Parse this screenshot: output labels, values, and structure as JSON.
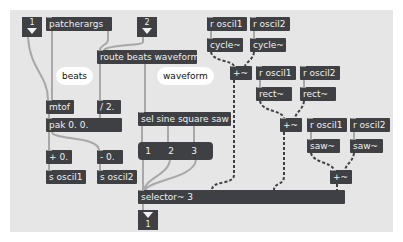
{
  "patch": {
    "inlets": [
      {
        "number": "1"
      },
      {
        "number": "2"
      }
    ],
    "outlets": [
      {
        "number": "1"
      }
    ],
    "objects": {
      "patcherargs": "patcherargs",
      "route": "route beats waveform",
      "mtof": "mtof",
      "div2": "/ 2.",
      "pak": "pak 0. 0.",
      "plus0": "+ 0.",
      "minus0": "- 0.",
      "s_oscil1": "s oscil1",
      "s_oscil2": "s oscil2",
      "sel": "sel sine square saw",
      "selector": "selector~ 3",
      "r_oscil1": "r oscil1",
      "r_oscil2": "r oscil2",
      "cycle": "cycle~",
      "rect": "rect~",
      "saw": "saw~",
      "plus_sig": "+~"
    },
    "comments": {
      "beats": "beats",
      "waveform": "waveform"
    },
    "message": {
      "items": [
        "1",
        "2",
        "3"
      ]
    }
  },
  "colors": {
    "canvas": "#e6e6e6",
    "object": "#3e4043",
    "object_text": "#f0f0f0",
    "patchcord": "#a8a8a8",
    "signal_cord": "#3e4043",
    "comment_bg": "#ffffff"
  }
}
